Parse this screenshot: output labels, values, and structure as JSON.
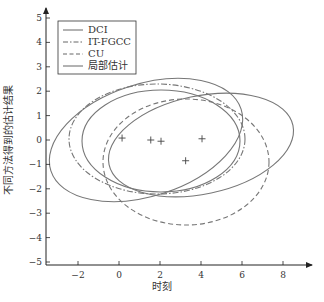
{
  "chart_data": {
    "type": "scatter",
    "title": "",
    "xlabel": "时刻",
    "ylabel": "不同方法得到的估计结果",
    "xlim": [
      -3.5,
      9.5
    ],
    "ylim": [
      -5.2,
      5.5
    ],
    "x_ticks": [
      -2,
      0,
      2,
      4,
      6,
      8
    ],
    "y_ticks": [
      5,
      4,
      3,
      2,
      1,
      0,
      -1,
      -2,
      -3,
      -4,
      -5
    ],
    "grid": false,
    "legend_position": "upper left",
    "legend": [
      {
        "label": "DCI",
        "style": "solid"
      },
      {
        "label": "IT-FGCC",
        "style": "dash-dot"
      },
      {
        "label": "CU",
        "style": "dashed"
      },
      {
        "label": "局部估计",
        "style": "solid"
      }
    ],
    "local_estimate_points": [
      {
        "x": 0.15,
        "y": 0.08
      },
      {
        "x": 1.55,
        "y": 0.0
      },
      {
        "x": 2.05,
        "y": -0.05
      },
      {
        "x": 4.05,
        "y": 0.05
      },
      {
        "x": 3.25,
        "y": -0.85
      }
    ],
    "ellipses": [
      {
        "name": "DCI",
        "style": "solid",
        "cx": 1.3,
        "cy": 0.0,
        "rx": 4.9,
        "ry": 2.3,
        "angle_deg": -18
      },
      {
        "name": "IT-FGCC",
        "style": "dash-dot",
        "cx": 1.85,
        "cy": 0.05,
        "rx": 4.3,
        "ry": 2.25,
        "angle_deg": 0
      },
      {
        "name": "CU",
        "style": "dashed",
        "cx": 3.25,
        "cy": -0.9,
        "rx": 4.05,
        "ry": 2.6,
        "angle_deg": 0
      },
      {
        "name": "局部估计 A",
        "style": "solid",
        "cx": 2.05,
        "cy": -0.05,
        "rx": 3.85,
        "ry": 2.1,
        "angle_deg": 0
      },
      {
        "name": "局部估计 B",
        "style": "solid",
        "cx": 4.0,
        "cy": -0.2,
        "rx": 4.6,
        "ry": 2.0,
        "angle_deg": -12
      }
    ]
  }
}
